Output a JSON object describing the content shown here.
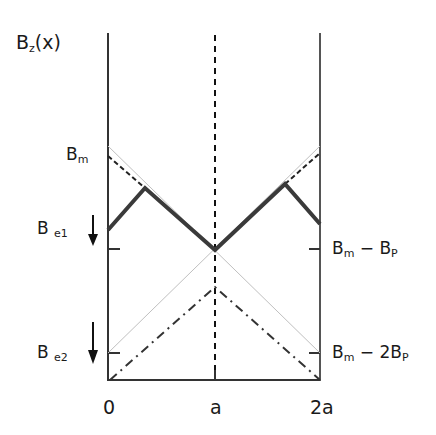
{
  "diagram": {
    "y_axis_label": {
      "main": "B",
      "sub": "z",
      "rest": "(x)"
    },
    "left_labels": {
      "bm": {
        "main": "B",
        "sub": "m"
      },
      "be1": {
        "main": "B",
        "sub": "e1"
      },
      "be2": {
        "main": "B",
        "sub": "e2"
      }
    },
    "right_labels": {
      "bm_minus_bp": {
        "main": "B",
        "sub": "m",
        "rest": " − B",
        "sub2": "P"
      },
      "bm_minus_2bp": {
        "main": "B",
        "sub": "m",
        "rest": " − 2B",
        "sub2": "P"
      }
    },
    "x_ticks": [
      "0",
      "a",
      "2a"
    ],
    "colors": {
      "axis": "#333333",
      "solid": "#3a3a3a",
      "thin": "#bbbbbb",
      "dash": "#222222"
    }
  }
}
